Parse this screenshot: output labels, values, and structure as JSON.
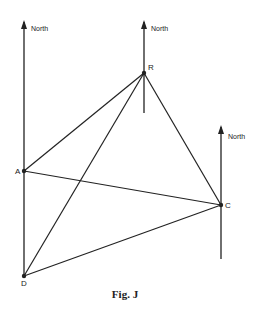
{
  "figure": {
    "caption": "Fig. J",
    "north_label": "North",
    "points": {
      "A": {
        "label": "A",
        "x": 24,
        "y": 171
      },
      "R": {
        "label": "R",
        "x": 144,
        "y": 73
      },
      "C": {
        "label": "C",
        "x": 221,
        "y": 205
      },
      "D": {
        "label": "D",
        "x": 24,
        "y": 276
      }
    },
    "north_arrows": [
      {
        "at": "A/D",
        "label": "North"
      },
      {
        "at": "R",
        "label": "North"
      },
      {
        "at": "C",
        "label": "North"
      }
    ],
    "segments": [
      "A-R",
      "R-D",
      "R-C",
      "A-C",
      "D-C",
      "A-D"
    ],
    "line_color": "#222222"
  }
}
